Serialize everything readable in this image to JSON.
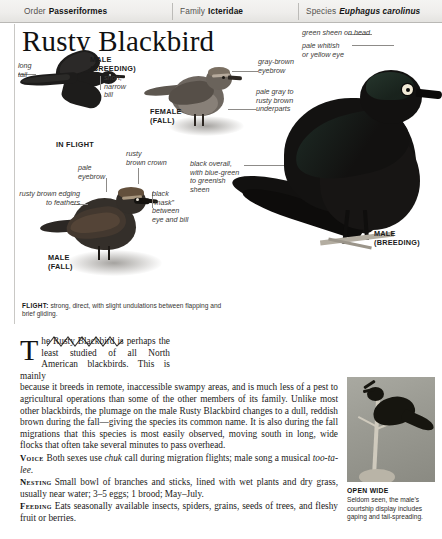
{
  "taxonomy": {
    "order_key": "Order",
    "order_value": "Passeriformes",
    "family_key": "Family",
    "family_value": "Icteridae",
    "species_key": "Species",
    "species_value": "Euphagus carolinus"
  },
  "title": "Rusty Blackbird",
  "plate": {
    "labels": [
      {
        "id": "long-tail",
        "text": "long\ntail"
      },
      {
        "id": "male-breeding-flight",
        "text": "MALE\n(BREEDING)"
      },
      {
        "id": "short-narrow-bill",
        "text": "short,\nnarrow\nbill"
      },
      {
        "id": "in-flight",
        "text": "IN FLIGHT"
      },
      {
        "id": "female-fall",
        "text": "FEMALE\n(FALL)"
      },
      {
        "id": "gray-brown-eyebrow",
        "text": "gray-brown\neyebrow"
      },
      {
        "id": "pale-gray-underparts",
        "text": "pale gray to\nrusty brown\nunderparts"
      },
      {
        "id": "rusty-brown-crown",
        "text": "rusty\nbrown crown"
      },
      {
        "id": "pale-eyebrow",
        "text": "pale\neyebrow"
      },
      {
        "id": "rusty-brown-edging",
        "text": "rusty brown edging\nto feathers"
      },
      {
        "id": "black-mask",
        "text": "black\n“mask”\nbetween\neye and bill"
      },
      {
        "id": "black-overall",
        "text": "black overall,\nwith blue-green\nto greenish\nsheen"
      },
      {
        "id": "male-fall",
        "text": "MALE\n(FALL)"
      },
      {
        "id": "green-sheen",
        "text": "green sheen on head"
      },
      {
        "id": "pale-eye",
        "text": "pale whitish\nor yellow eye"
      },
      {
        "id": "male-breeding-perched",
        "text": "MALE\n(BREEDING)"
      }
    ],
    "flight_heading": "FLIGHT:",
    "flight_text": " strong, direct, with slight undulations between flapping and brief gliding."
  },
  "body": {
    "dropcap": "T",
    "intro_narrow": "he Rusty Blackbird is perhaps the least studied of all North American blackbirds. This is mainly",
    "intro_rest": "because it breeds in remote, inaccessible swampy areas, and is much less of a pest to agricultural operations than some of the other members of its family. Unlike most other blackbirds, the plumage on the male Rusty Blackbird changes to a dull, reddish brown during the fall—giving the species its common name. It is also during the fall migrations that this species is most easily observed, moving south in long, wide flocks that often take several minutes to pass overhead.",
    "sections": [
      {
        "heading": "Voice",
        "parts": [
          {
            "t": "Both sexes use ",
            "i": false
          },
          {
            "t": "chuk",
            "i": true
          },
          {
            "t": " call during migration flights; male song a musical ",
            "i": false
          },
          {
            "t": "too-ta-lee",
            "i": true
          },
          {
            "t": ".",
            "i": false
          }
        ]
      },
      {
        "heading": "Nesting",
        "parts": [
          {
            "t": "Small bowl of branches and sticks, lined with wet plants and dry grass, usually near water; 3–5 eggs; 1 brood; May–July.",
            "i": false
          }
        ]
      },
      {
        "heading": "Feeding",
        "parts": [
          {
            "t": "Eats seasonally available insects, spiders, grains, seeds of trees, and fleshy fruit or berries.",
            "i": false
          }
        ]
      }
    ]
  },
  "photo": {
    "caption_title": "OPEN WIDE",
    "caption_text": "Seldom seen, the male’s courtship display includes gaping and tail-spreading."
  },
  "colors": {
    "header_bg": "#efeeec",
    "header_rule": "#b9b8b5",
    "ink": "#1d1c1b",
    "label_text": "#3d3b39",
    "body_text": "#1b1a19"
  }
}
